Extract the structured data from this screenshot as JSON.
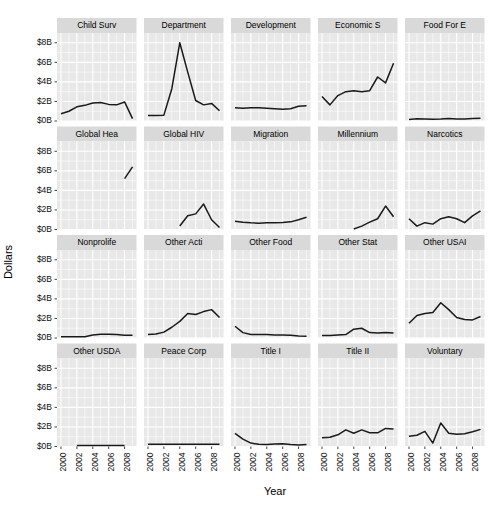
{
  "chart_data": {
    "type": "line",
    "title": "",
    "xlabel": "Year",
    "ylabel": "Dollars",
    "xlim": [
      1999.5,
      2009.5
    ],
    "ylim": [
      0,
      9
    ],
    "grid": true,
    "legend": "none",
    "facet_layout": {
      "rows": 4,
      "cols": 5
    },
    "x_ticks": [
      2000,
      2002,
      2004,
      2006,
      2008
    ],
    "x_tick_labels": [
      "2000",
      "2002",
      "2004",
      "2006",
      "2008"
    ],
    "y_ticks": [
      0,
      2,
      4,
      6,
      8
    ],
    "y_tick_labels": [
      "$0B",
      "$2B",
      "$4B",
      "$6B",
      "$8B"
    ],
    "y_units": "billions of dollars",
    "x": [
      2000,
      2001,
      2002,
      2003,
      2004,
      2005,
      2006,
      2007,
      2008,
      2009
    ],
    "panels": [
      {
        "name": "Child Surv",
        "x": [
          2000,
          2001,
          2002,
          2003,
          2004,
          2005,
          2006,
          2007,
          2008,
          2009
        ],
        "values": [
          0.75,
          1.0,
          1.45,
          1.6,
          1.85,
          1.9,
          1.7,
          1.65,
          1.95,
          0.25
        ]
      },
      {
        "name": "Department",
        "x": [
          2000,
          2001,
          2002,
          2003,
          2004,
          2005,
          2006,
          2007,
          2008,
          2009
        ],
        "values": [
          0.55,
          0.55,
          0.6,
          3.3,
          8.0,
          5.0,
          2.1,
          1.65,
          1.8,
          1.05
        ]
      },
      {
        "name": "Development",
        "x": [
          2000,
          2001,
          2002,
          2003,
          2004,
          2005,
          2006,
          2007,
          2008,
          2009
        ],
        "values": [
          1.35,
          1.3,
          1.35,
          1.35,
          1.3,
          1.25,
          1.2,
          1.25,
          1.5,
          1.55
        ]
      },
      {
        "name": "Economic S",
        "x": [
          2000,
          2001,
          2002,
          2003,
          2004,
          2005,
          2006,
          2007,
          2008,
          2009
        ],
        "values": [
          2.5,
          1.65,
          2.6,
          3.0,
          3.1,
          3.0,
          3.1,
          4.5,
          3.9,
          5.9
        ]
      },
      {
        "name": "Food For E",
        "x": [
          2000,
          2001,
          2002,
          2003,
          2004,
          2005,
          2006,
          2007,
          2008,
          2009
        ],
        "values": [
          0.15,
          0.22,
          0.2,
          0.18,
          0.2,
          0.25,
          0.2,
          0.2,
          0.25,
          0.28
        ]
      },
      {
        "name": "Global Hea",
        "x": [
          2008,
          2009
        ],
        "values": [
          5.2,
          6.4
        ]
      },
      {
        "name": "Global HIV",
        "x": [
          2004,
          2005,
          2006,
          2007,
          2008,
          2009
        ],
        "values": [
          0.35,
          1.4,
          1.6,
          2.6,
          1.0,
          0.2
        ]
      },
      {
        "name": "Migration",
        "x": [
          2000,
          2001,
          2002,
          2003,
          2004,
          2005,
          2006,
          2007,
          2008,
          2009
        ],
        "values": [
          0.85,
          0.75,
          0.68,
          0.65,
          0.7,
          0.7,
          0.72,
          0.78,
          1.0,
          1.25
        ]
      },
      {
        "name": "Millennium",
        "x": [
          2004,
          2005,
          2006,
          2007,
          2008,
          2009
        ],
        "values": [
          0.05,
          0.35,
          0.75,
          1.1,
          2.4,
          1.3
        ]
      },
      {
        "name": "Narcotics",
        "x": [
          2000,
          2001,
          2002,
          2003,
          2004,
          2005,
          2006,
          2007,
          2008,
          2009
        ],
        "values": [
          1.1,
          0.35,
          0.7,
          0.55,
          1.1,
          1.3,
          1.1,
          0.7,
          1.4,
          1.9
        ]
      },
      {
        "name": "Nonprolife",
        "x": [
          2000,
          2001,
          2002,
          2003,
          2004,
          2005,
          2006,
          2007,
          2008,
          2009
        ],
        "values": [
          0.12,
          0.12,
          0.12,
          0.12,
          0.3,
          0.38,
          0.38,
          0.35,
          0.28,
          0.28
        ]
      },
      {
        "name": "Other Acti",
        "x": [
          2000,
          2001,
          2002,
          2003,
          2004,
          2005,
          2006,
          2007,
          2008,
          2009
        ],
        "values": [
          0.35,
          0.4,
          0.6,
          1.1,
          1.7,
          2.5,
          2.4,
          2.7,
          2.9,
          2.1
        ]
      },
      {
        "name": "Other Food",
        "x": [
          2000,
          2001,
          2002,
          2003,
          2004,
          2005,
          2006,
          2007,
          2008,
          2009
        ],
        "values": [
          1.2,
          0.55,
          0.35,
          0.35,
          0.35,
          0.3,
          0.3,
          0.28,
          0.2,
          0.18
        ]
      },
      {
        "name": "Other Stat",
        "x": [
          2000,
          2001,
          2002,
          2003,
          2004,
          2005,
          2006,
          2007,
          2008,
          2009
        ],
        "values": [
          0.25,
          0.25,
          0.3,
          0.35,
          0.9,
          1.0,
          0.55,
          0.5,
          0.55,
          0.5
        ]
      },
      {
        "name": "Other USAI",
        "x": [
          2000,
          2001,
          2002,
          2003,
          2004,
          2005,
          2006,
          2007,
          2008,
          2009
        ],
        "values": [
          1.5,
          2.3,
          2.5,
          2.6,
          3.6,
          2.9,
          2.1,
          1.9,
          1.85,
          2.2
        ]
      },
      {
        "name": "Other USDA",
        "x": [
          2002,
          2003,
          2004,
          2005,
          2006,
          2007,
          2008
        ],
        "values": [
          0.1,
          0.1,
          0.1,
          0.1,
          0.1,
          0.1,
          0.1
        ]
      },
      {
        "name": "Peace Corp",
        "x": [
          2000,
          2001,
          2002,
          2003,
          2004,
          2005,
          2006,
          2007,
          2008,
          2009
        ],
        "values": [
          0.22,
          0.22,
          0.22,
          0.22,
          0.22,
          0.22,
          0.22,
          0.22,
          0.22,
          0.22
        ]
      },
      {
        "name": "Title I",
        "x": [
          2000,
          2001,
          2002,
          2003,
          2004,
          2005,
          2006,
          2007,
          2008,
          2009
        ],
        "values": [
          1.35,
          0.75,
          0.35,
          0.22,
          0.2,
          0.25,
          0.28,
          0.2,
          0.15,
          0.2
        ]
      },
      {
        "name": "Title II",
        "x": [
          2000,
          2001,
          2002,
          2003,
          2004,
          2005,
          2006,
          2007,
          2008,
          2009
        ],
        "values": [
          0.9,
          0.95,
          1.2,
          1.7,
          1.35,
          1.7,
          1.4,
          1.4,
          1.85,
          1.8
        ]
      },
      {
        "name": "Voluntary",
        "x": [
          2000,
          2001,
          2002,
          2003,
          2004,
          2005,
          2006,
          2007,
          2008,
          2009
        ],
        "values": [
          1.05,
          1.15,
          1.55,
          0.35,
          2.4,
          1.35,
          1.25,
          1.3,
          1.5,
          1.75
        ]
      }
    ]
  },
  "axes": {
    "y_title": "Dollars",
    "x_title": "Year",
    "y_tick_labels": [
      "$8B",
      "$6B",
      "$4B",
      "$2B",
      "$0B"
    ],
    "x_tick_labels": [
      "2000",
      "2002",
      "2004",
      "2006",
      "2008"
    ]
  },
  "panel_titles": [
    "Child Surv",
    "Department",
    "Development",
    "Economic S",
    "Food For E",
    "Global Hea",
    "Global HIV",
    "Migration",
    "Millennium",
    "Narcotics",
    "Nonprolife",
    "Other Acti",
    "Other Food",
    "Other Stat",
    "Other USAI",
    "Other USDA",
    "Peace Corp",
    "Title I",
    "Title II",
    "Voluntary"
  ],
  "colors": {
    "panel_background": "#e8e8e8",
    "strip_background": "#d9d9d9",
    "gridline": "#ffffff",
    "line": "#1a1a1a",
    "text": "#000000",
    "page_background": "#ffffff"
  }
}
